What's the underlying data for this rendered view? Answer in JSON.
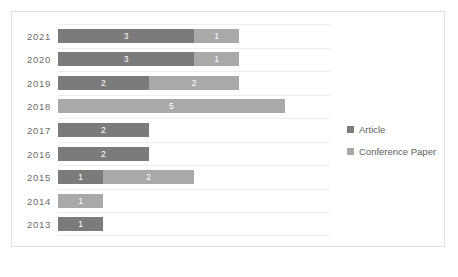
{
  "chart_data": {
    "type": "bar",
    "orientation": "horizontal",
    "stacked": true,
    "title": "",
    "xlabel": "",
    "ylabel": "",
    "categories": [
      "2021",
      "2020",
      "2019",
      "2018",
      "2017",
      "2016",
      "2015",
      "2014",
      "2013"
    ],
    "series": [
      {
        "name": "Article",
        "color": "#7b7b7b",
        "values": [
          3,
          3,
          2,
          0,
          2,
          2,
          1,
          0,
          1
        ]
      },
      {
        "name": "Conference Paper",
        "color": "#a9a9a9",
        "values": [
          1,
          1,
          2,
          5,
          0,
          0,
          2,
          1,
          0
        ]
      }
    ],
    "totals": [
      4,
      4,
      4,
      5,
      2,
      2,
      3,
      1,
      1
    ],
    "xlim": [
      0,
      6
    ],
    "grid": true,
    "grid_axis": "y",
    "legend_position": "right",
    "data_labels": true,
    "axis_ticks_visible": false
  },
  "legend": {
    "items": [
      {
        "label": "Article",
        "swatch": "article"
      },
      {
        "label": "Conference Paper",
        "swatch": "conference"
      }
    ]
  },
  "caption": {
    "text": ""
  }
}
